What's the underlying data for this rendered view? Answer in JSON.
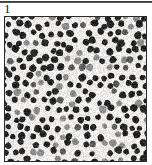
{
  "figure": {
    "label": "1",
    "rule": {
      "present": true,
      "color": "#2e2e2e"
    },
    "image": {
      "kind": "micrograph",
      "description": "dense quasi-random packing of dark round particles with scattered gray particles",
      "frame_color": "#2b2b2b",
      "background_color": "#f2f1ef",
      "dark_particle_color": "#262626",
      "gray_particle_color": "#8e8e8e",
      "mid_particle_color": "#5c5c5c",
      "particle_diameter_px": 6.6,
      "particle_spacing_px": 9.4,
      "width_px": 141,
      "height_px": 144,
      "seed": 20394,
      "gray_fraction": 0.2,
      "mid_fraction": 0.08,
      "jitter": 2.5
    }
  }
}
